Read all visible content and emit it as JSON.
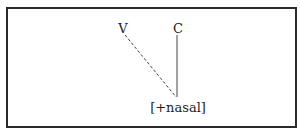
{
  "diagram": {
    "type": "autosegmental-feature-spreading",
    "nodes": [
      {
        "id": "V",
        "label": "V",
        "x": 123,
        "y": 32
      },
      {
        "id": "C",
        "label": "C",
        "x": 177,
        "y": 32
      },
      {
        "id": "nasal",
        "label": "[+nasal]",
        "x": 178,
        "y": 112
      }
    ],
    "edges": [
      {
        "from": "V",
        "to": "nasal",
        "style": "dashed"
      },
      {
        "from": "C",
        "to": "nasal",
        "style": "solid"
      }
    ]
  },
  "labels": {
    "v": "V",
    "c": "C",
    "feature": "[+nasal]"
  }
}
